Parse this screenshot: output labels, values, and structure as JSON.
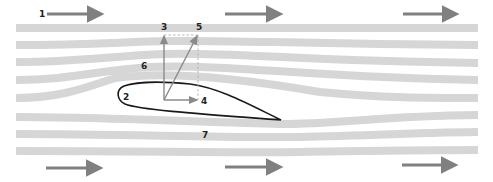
{
  "diagram": {
    "colors": {
      "streamline": "#d6d6d6",
      "flow_arrow": "#808080",
      "vector": "#8a8a8a",
      "airfoil_outline": "#1a1a1a",
      "label": "#222222",
      "dashed": "#b0b0b0"
    },
    "labels": {
      "l1": "1",
      "l2": "2",
      "l3": "3",
      "l4": "4",
      "l5": "5",
      "l6": "6",
      "l7": "7"
    },
    "legend_meaning": {
      "1": "free-stream flow direction",
      "2": "airfoil (wing section)",
      "3": "lift force",
      "4": "drag force",
      "5": "resultant aerodynamic force",
      "6": "upper surface flow (low pressure)",
      "7": "lower surface flow (high pressure)"
    },
    "streamlines_count": 8,
    "top_flow_arrows": 3,
    "bottom_flow_arrows": 3
  }
}
